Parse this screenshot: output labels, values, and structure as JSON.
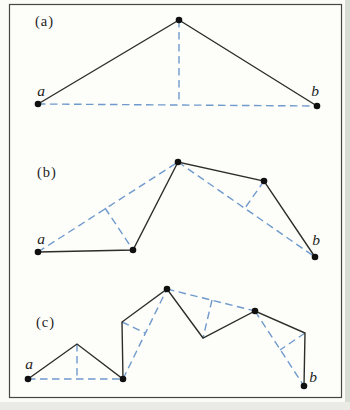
{
  "figure": {
    "canvas": {
      "width": 350,
      "height": 410
    },
    "colors": {
      "background": "#fbfbf7",
      "panel_background": "#fdfdfa",
      "frame": "#464642",
      "solid_line": "#2d2d2b",
      "dashed_line": "#6f9acc",
      "dot": "#101010",
      "text": "#1e1e1c"
    },
    "frame": {
      "x": 9,
      "y": 4,
      "width": 332,
      "height": 393
    },
    "panels": [
      {
        "id": "a",
        "label": "(a)",
        "label_pos": {
          "x": 35,
          "y": 26
        },
        "solid_path": [
          [
            38,
            104
          ],
          [
            179,
            20
          ],
          [
            317,
            106
          ]
        ],
        "dashed_segments": [
          [
            [
              38,
              104
            ],
            [
              317,
              106
            ]
          ],
          [
            [
              179,
              20
            ],
            [
              179,
              104
            ]
          ]
        ],
        "dots": [
          [
            38,
            104
          ],
          [
            179,
            20
          ],
          [
            317,
            106
          ]
        ],
        "point_labels": [
          {
            "text": "a",
            "x": 41,
            "y": 96
          },
          {
            "text": "b",
            "x": 315,
            "y": 96
          }
        ]
      },
      {
        "id": "b",
        "label": "(b)",
        "label_pos": {
          "x": 37,
          "y": 177
        },
        "solid_path": [
          [
            38,
            252
          ],
          [
            133,
            250
          ],
          [
            178,
            162
          ],
          [
            264,
            181
          ],
          [
            315,
            257
          ]
        ],
        "dashed_segments": [
          [
            [
              38,
              252
            ],
            [
              178,
              162
            ]
          ],
          [
            [
              105,
              208
            ],
            [
              133,
              250
            ]
          ],
          [
            [
              178,
              162
            ],
            [
              315,
              257
            ]
          ],
          [
            [
              264,
              181
            ],
            [
              245,
              208
            ]
          ]
        ],
        "dots": [
          [
            38,
            252
          ],
          [
            133,
            250
          ],
          [
            178,
            162
          ],
          [
            264,
            181
          ],
          [
            315,
            257
          ]
        ],
        "point_labels": [
          {
            "text": "a",
            "x": 41,
            "y": 244
          },
          {
            "text": "b",
            "x": 316,
            "y": 245
          }
        ]
      },
      {
        "id": "c",
        "label": "(c)",
        "label_pos": {
          "x": 36,
          "y": 327
        },
        "solid_path": [
          [
            28,
            379
          ],
          [
            77,
            344
          ],
          [
            123,
            379
          ],
          [
            122,
            322
          ],
          [
            167,
            289
          ],
          [
            203,
            338
          ],
          [
            255,
            311
          ],
          [
            305,
            333
          ],
          [
            304,
            386
          ]
        ],
        "dashed_segments": [
          [
            [
              28,
              379
            ],
            [
              123,
              379
            ]
          ],
          [
            [
              77,
              344
            ],
            [
              77,
              379
            ]
          ],
          [
            [
              123,
              379
            ],
            [
              167,
              289
            ]
          ],
          [
            [
              122,
              322
            ],
            [
              145,
              333
            ]
          ],
          [
            [
              167,
              289
            ],
            [
              255,
              311
            ]
          ],
          [
            [
              212,
              300
            ],
            [
              203,
              338
            ]
          ],
          [
            [
              255,
              311
            ],
            [
              304,
              386
            ]
          ],
          [
            [
              305,
              333
            ],
            [
              280,
              350
            ]
          ]
        ],
        "dots": [
          [
            28,
            379
          ],
          [
            123,
            379
          ],
          [
            167,
            289
          ],
          [
            255,
            311
          ],
          [
            304,
            386
          ]
        ],
        "point_labels": [
          {
            "text": "a",
            "x": 29,
            "y": 369
          },
          {
            "text": "b",
            "x": 313,
            "y": 382
          }
        ]
      }
    ],
    "dot_radius": 3.3
  }
}
